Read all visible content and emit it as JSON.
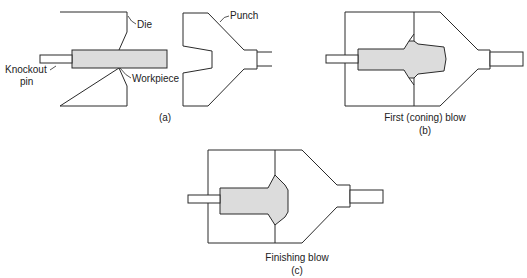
{
  "figure": {
    "panels": [
      {
        "id": "a",
        "caption": "(a)",
        "subtitle": "",
        "labels": {
          "die": "Die",
          "punch": "Punch",
          "workpiece": "Workpiece",
          "knockout_pin_line1": "Knockout",
          "knockout_pin_line2": "pin"
        }
      },
      {
        "id": "b",
        "caption": "(b)",
        "subtitle": "First (coning) blow"
      },
      {
        "id": "c",
        "caption": "(c)",
        "subtitle": "Finishing blow"
      }
    ],
    "colors": {
      "outline": "#2a2a2a",
      "workpiece_fill": "#dcdcdc",
      "background": "#ffffff"
    }
  }
}
